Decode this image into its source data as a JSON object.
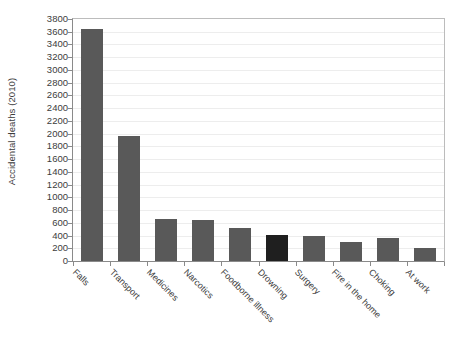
{
  "chart_data": {
    "type": "bar",
    "title": "",
    "subtitle": "",
    "xlabel": "",
    "ylabel": "Accidental deaths (2010)",
    "categories": [
      "Falls",
      "Transport",
      "Medicines",
      "Narcotics",
      "Foodborne illness",
      "Drowning",
      "Surgery",
      "Fire in the home",
      "Choking",
      "At work"
    ],
    "values": [
      3650,
      1960,
      660,
      640,
      520,
      410,
      390,
      300,
      360,
      205
    ],
    "ylim": [
      0,
      3800
    ],
    "ytick_step": 200,
    "yticks": [
      "0",
      "200",
      "400",
      "600",
      "800",
      "1000",
      "1200",
      "1400",
      "1600",
      "1800",
      "2000",
      "2200",
      "2400",
      "2600",
      "2800",
      "3000",
      "3200",
      "3400",
      "3600",
      "3800"
    ],
    "grid": true,
    "legend": "none",
    "bar_color": "#595959",
    "highlight_color": "#1f1f1f",
    "highlighted_category": "Drowning",
    "gridline_color": "#ededed",
    "axis_color": "#8a8a8a",
    "plot_border_color": "#bcbcbc",
    "background_color": "#ffffff",
    "text_color": "#3c3c3c",
    "xlabel_rotation_deg": 45
  }
}
